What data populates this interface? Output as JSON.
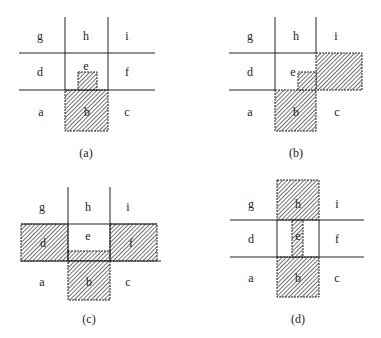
{
  "figure": {
    "panels": [
      {
        "id": "a",
        "caption": "(a)",
        "cells": {
          "g": "g",
          "h": "h",
          "i": "i",
          "d": "d",
          "e": "e",
          "f": "f",
          "a": "a",
          "b": "b",
          "c": "c"
        },
        "shaded_regions": [
          "b",
          "small square inside e (bottom)"
        ]
      },
      {
        "id": "b",
        "caption": "(b)",
        "cells": {
          "g": "g",
          "h": "h",
          "i": "i",
          "d": "d",
          "e": "e",
          "f": "f",
          "a": "a",
          "b": "b",
          "c": "c"
        },
        "shaded_regions": [
          "b",
          "f",
          "small square inside e (bottom-right)"
        ]
      },
      {
        "id": "c",
        "caption": "(c)",
        "cells": {
          "g": "g",
          "h": "h",
          "i": "i",
          "d": "d",
          "e": "e",
          "f": "f",
          "a": "a",
          "b": "b",
          "c": "c"
        },
        "shaded_regions": [
          "d",
          "f",
          "b",
          "bottom strip of e"
        ]
      },
      {
        "id": "d",
        "caption": "(d)",
        "cells": {
          "g": "g",
          "h": "h",
          "i": "i",
          "d": "d",
          "e": "e",
          "f": "f",
          "a": "a",
          "b": "b",
          "c": "c"
        },
        "shaded_regions": [
          "h",
          "b",
          "vertical strip in center of e"
        ]
      }
    ],
    "colors": {
      "line": "#222222",
      "hatch": "#333333",
      "background": "#ffffff"
    }
  }
}
